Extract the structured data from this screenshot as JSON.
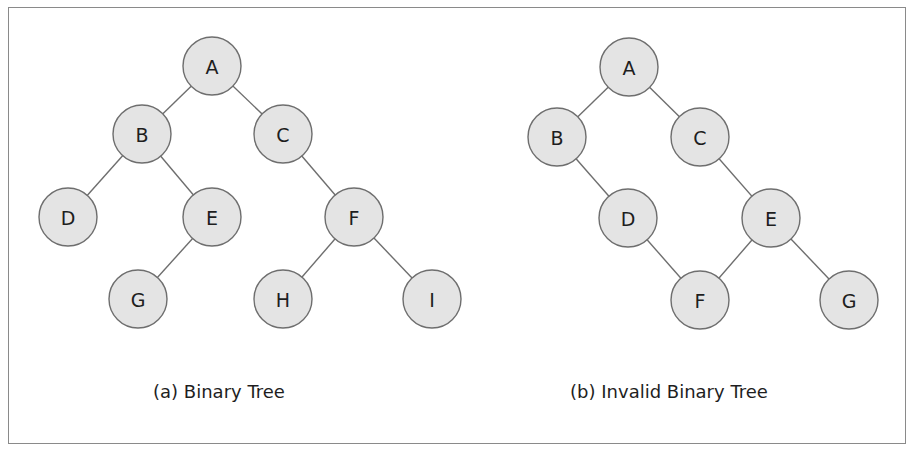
{
  "diagram": {
    "colors": {
      "node_fill": "#e4e4e4",
      "node_stroke": "#6e6e6e",
      "edge": "#6e6e6e",
      "text": "#1e1e1e",
      "frame_border": "#8a8a8a"
    },
    "node_radius": 29,
    "panels": [
      {
        "id": "a",
        "caption": "(a) Binary Tree",
        "caption_x": 219,
        "nodes": [
          {
            "id": "A",
            "label": "A",
            "x": 212,
            "y": 66
          },
          {
            "id": "B",
            "label": "B",
            "x": 142,
            "y": 134
          },
          {
            "id": "C",
            "label": "C",
            "x": 283,
            "y": 134
          },
          {
            "id": "D",
            "label": "D",
            "x": 68,
            "y": 217
          },
          {
            "id": "E",
            "label": "E",
            "x": 212,
            "y": 217
          },
          {
            "id": "F",
            "label": "F",
            "x": 354,
            "y": 217
          },
          {
            "id": "G",
            "label": "G",
            "x": 138,
            "y": 299
          },
          {
            "id": "H",
            "label": "H",
            "x": 283,
            "y": 299
          },
          {
            "id": "I",
            "label": "I",
            "x": 432,
            "y": 299
          }
        ],
        "edges": [
          [
            "A",
            "B"
          ],
          [
            "A",
            "C"
          ],
          [
            "B",
            "D"
          ],
          [
            "B",
            "E"
          ],
          [
            "E",
            "G"
          ],
          [
            "C",
            "F"
          ],
          [
            "F",
            "H"
          ],
          [
            "F",
            "I"
          ]
        ]
      },
      {
        "id": "b",
        "caption": "(b) Invalid Binary Tree",
        "caption_x": 669,
        "nodes": [
          {
            "id": "A",
            "label": "A",
            "x": 629,
            "y": 67
          },
          {
            "id": "B",
            "label": "B",
            "x": 557,
            "y": 137
          },
          {
            "id": "C",
            "label": "C",
            "x": 700,
            "y": 137
          },
          {
            "id": "D",
            "label": "D",
            "x": 628,
            "y": 218
          },
          {
            "id": "E",
            "label": "E",
            "x": 771,
            "y": 218
          },
          {
            "id": "F",
            "label": "F",
            "x": 700,
            "y": 300
          },
          {
            "id": "G",
            "label": "G",
            "x": 849,
            "y": 300
          }
        ],
        "edges": [
          [
            "A",
            "B"
          ],
          [
            "A",
            "C"
          ],
          [
            "B",
            "D"
          ],
          [
            "C",
            "E"
          ],
          [
            "D",
            "F"
          ],
          [
            "E",
            "F"
          ],
          [
            "E",
            "G"
          ]
        ]
      }
    ]
  }
}
